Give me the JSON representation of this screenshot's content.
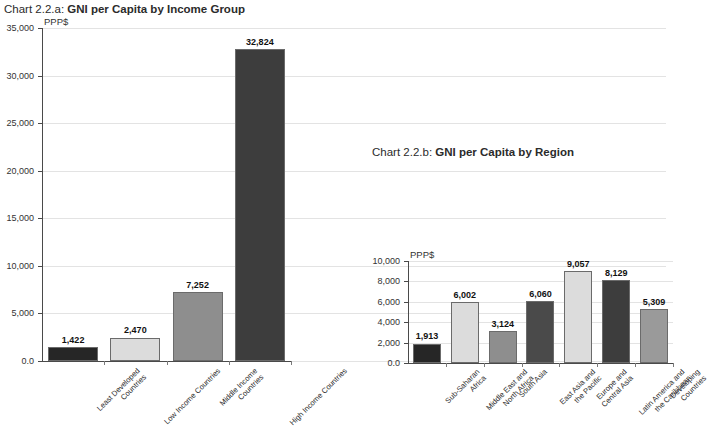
{
  "page": {
    "background": "#ffffff",
    "width": 681,
    "height": 428
  },
  "chart_a": {
    "title_number": "Chart 2.2.a: ",
    "title_name": "GNI per Capita by Income Group",
    "unit_label": "PPP$",
    "y_tick_labels": [
      "35,000",
      "30,000",
      "25,000",
      "20,000",
      "15,000",
      "10,000",
      "5,000",
      "0.0"
    ],
    "categories": [
      "Least Developed\nCountries",
      "Low Income Countries",
      "Middle Income\nCountries",
      "High Income Countries"
    ],
    "value_labels": [
      "1,422",
      "2,470",
      "7,252",
      "32,824"
    ],
    "bar_colors": [
      "#262626",
      "#dcdcdc",
      "#8e8e8e",
      "#3d3d3d"
    ]
  },
  "chart_b": {
    "title_number": "Chart 2.2.b: ",
    "title_name": "GNI per Capita by Region",
    "unit_label": "PPP$",
    "y_tick_labels": [
      "10,000",
      "8,000",
      "6,000",
      "4,000",
      "2,000",
      "0.0"
    ],
    "categories": [
      "Sub-Saharan\nAfrica",
      "Middle East and\nNorth Africa",
      "South Asia",
      "East Asia and\nthe Pacific",
      "Europe and\nCentral Asia",
      "Latin America and\nthe Caribbean",
      "Developing\nCountries"
    ],
    "value_labels": [
      "1,913",
      "6,002",
      "3,124",
      "6,060",
      "9,057",
      "8,129",
      "5,309"
    ],
    "bar_colors": [
      "#262626",
      "#dcdcdc",
      "#8e8e8e",
      "#4a4a4a",
      "#dcdcdc",
      "#3d3d3d",
      "#9a9a9a"
    ]
  },
  "chart_data": [
    {
      "type": "bar",
      "id": "chart-2-2-a",
      "title": "Chart 2.2.a: GNI per Capita by Income Group",
      "xlabel": "",
      "ylabel": "PPP$",
      "ylim": [
        0,
        35000
      ],
      "ytick_values": [
        0,
        5000,
        10000,
        15000,
        20000,
        25000,
        30000,
        35000
      ],
      "grid": true,
      "legend": "none",
      "categories": [
        "Least Developed Countries",
        "Low Income Countries",
        "Middle Income Countries",
        "High Income Countries"
      ],
      "values": [
        1422,
        2470,
        7252,
        32824
      ]
    },
    {
      "type": "bar",
      "id": "chart-2-2-b",
      "title": "Chart 2.2.b: GNI per Capita by Region",
      "xlabel": "",
      "ylabel": "PPP$",
      "ylim": [
        0,
        10000
      ],
      "ytick_values": [
        0,
        2000,
        4000,
        6000,
        8000,
        10000
      ],
      "grid": true,
      "legend": "none",
      "categories": [
        "Sub-Saharan Africa",
        "Middle East and North Africa",
        "South Asia",
        "East Asia and the Pacific",
        "Europe and Central Asia",
        "Latin America and the Caribbean",
        "Developing Countries"
      ],
      "values": [
        1913,
        6002,
        3124,
        6060,
        9057,
        8129,
        5309
      ]
    }
  ]
}
